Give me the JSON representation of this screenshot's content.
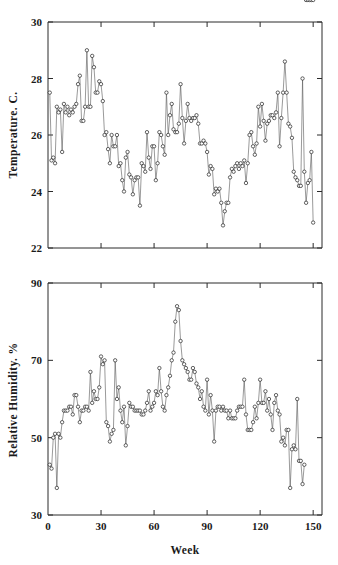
{
  "figure": {
    "background": "#ffffff",
    "line_color": "#555555",
    "marker_fill": "#ffffff",
    "marker_stroke": "#222222",
    "axis_color": "#2a2a2a"
  },
  "chart_data": [
    {
      "type": "line",
      "panel": "top",
      "title": "",
      "xlabel": "",
      "ylabel": "Temperature. C.",
      "xlim": [
        0,
        155
      ],
      "ylim": [
        22,
        30
      ],
      "yticks": [
        22,
        24,
        26,
        28,
        30
      ],
      "ytick_labels": [
        "22",
        "24",
        "26",
        "28",
        "30"
      ],
      "xticks": [
        0,
        30,
        60,
        90,
        120,
        150
      ],
      "xtick_labels": [
        "",
        "",
        "",
        "",
        "",
        ""
      ],
      "grid": false,
      "legend": "none",
      "marker": "circle-open",
      "x": [
        1,
        2,
        3,
        4,
        5,
        6,
        7,
        8,
        9,
        10,
        11,
        12,
        13,
        14,
        15,
        16,
        17,
        18,
        19,
        20,
        21,
        22,
        23,
        24,
        25,
        26,
        27,
        28,
        29,
        30,
        31,
        32,
        33,
        34,
        35,
        36,
        37,
        38,
        39,
        40,
        41,
        42,
        43,
        44,
        45,
        46,
        47,
        48,
        49,
        50,
        51,
        52,
        53,
        54,
        55,
        56,
        57,
        58,
        59,
        60,
        61,
        62,
        63,
        64,
        65,
        66,
        67,
        68,
        69,
        70,
        71,
        72,
        73,
        74,
        75,
        76,
        77,
        78,
        79,
        80,
        81,
        82,
        83,
        84,
        85,
        86,
        87,
        88,
        89,
        90,
        91,
        92,
        93,
        94,
        95,
        96,
        97,
        98,
        99,
        100,
        101,
        102,
        103,
        104,
        105,
        106,
        107,
        108,
        109,
        110,
        111,
        112,
        113,
        114,
        115,
        116,
        117,
        118,
        119,
        120,
        121,
        122,
        123,
        124,
        125,
        126,
        127,
        128,
        129,
        130,
        131,
        132,
        133,
        134,
        135,
        136,
        137,
        138,
        139,
        140,
        141,
        142,
        143,
        144,
        145,
        146,
        147,
        148,
        149,
        150
      ],
      "values": [
        27.5,
        25.1,
        25.2,
        25.0,
        27.0,
        26.8,
        26.9,
        25.4,
        27.1,
        26.8,
        27.0,
        26.7,
        26.9,
        26.8,
        27.0,
        27.1,
        27.8,
        28.1,
        26.5,
        26.5,
        27.0,
        29.0,
        27.0,
        27.0,
        28.8,
        28.4,
        27.5,
        27.5,
        27.9,
        27.8,
        27.2,
        26.0,
        26.1,
        25.5,
        25.0,
        26.0,
        25.6,
        25.6,
        26.0,
        24.9,
        25.0,
        24.4,
        24.0,
        25.2,
        25.4,
        24.6,
        24.5,
        23.9,
        24.4,
        24.5,
        24.5,
        23.5,
        25.0,
        24.9,
        24.7,
        26.1,
        25.2,
        24.8,
        25.6,
        25.6,
        24.4,
        25.0,
        26.1,
        26.0,
        25.6,
        25.3,
        27.5,
        26.0,
        26.7,
        27.1,
        26.2,
        26.1,
        26.1,
        26.4,
        27.8,
        26.6,
        25.7,
        26.5,
        27.1,
        26.6,
        26.5,
        26.6,
        26.6,
        26.7,
        26.4,
        25.7,
        25.7,
        25.8,
        25.7,
        25.4,
        24.6,
        24.9,
        24.8,
        23.9,
        24.1,
        24.0,
        24.1,
        23.6,
        22.8,
        23.3,
        23.6,
        23.6,
        24.5,
        24.8,
        24.7,
        24.9,
        25.0,
        24.8,
        25.0,
        24.9,
        25.1,
        24.3,
        25.0,
        26.0,
        26.1,
        25.6,
        25.3,
        25.7,
        27.0,
        26.3,
        27.1,
        26.5,
        25.8,
        26.4,
        26.5,
        26.7,
        26.7,
        26.6,
        26.8,
        27.5,
        25.6,
        26.6,
        27.5,
        28.6,
        27.5,
        26.4,
        26.3,
        25.9,
        24.7,
        24.5,
        24.4,
        24.2,
        24.2,
        28.0,
        24.7,
        23.6,
        24.3,
        24.4,
        25.4,
        22.9,
        25.0
      ]
    },
    {
      "type": "line",
      "panel": "bottom",
      "title": "",
      "xlabel": "Week",
      "ylabel": "Relative Humidity. %",
      "xlim": [
        0,
        155
      ],
      "ylim": [
        30,
        90
      ],
      "yticks": [
        30,
        50,
        70,
        90
      ],
      "ytick_labels": [
        "30",
        "50",
        "70",
        "90"
      ],
      "xticks": [
        0,
        30,
        60,
        90,
        120,
        150
      ],
      "xtick_labels": [
        "0",
        "30",
        "60",
        "90",
        "120",
        "150"
      ],
      "grid": false,
      "legend": "none",
      "marker": "circle-open",
      "x": [
        1,
        2,
        3,
        4,
        5,
        6,
        7,
        8,
        9,
        10,
        11,
        12,
        13,
        14,
        15,
        16,
        17,
        18,
        19,
        20,
        21,
        22,
        23,
        24,
        25,
        26,
        27,
        28,
        29,
        30,
        31,
        32,
        33,
        34,
        35,
        36,
        37,
        38,
        39,
        40,
        41,
        42,
        43,
        44,
        45,
        46,
        47,
        48,
        49,
        50,
        51,
        52,
        53,
        54,
        55,
        56,
        57,
        58,
        59,
        60,
        61,
        62,
        63,
        64,
        65,
        66,
        67,
        68,
        69,
        70,
        71,
        72,
        73,
        74,
        75,
        76,
        77,
        78,
        79,
        80,
        81,
        82,
        83,
        84,
        85,
        86,
        87,
        88,
        89,
        90,
        91,
        92,
        93,
        94,
        95,
        96,
        97,
        98,
        99,
        100,
        101,
        102,
        103,
        104,
        105,
        106,
        107,
        108,
        109,
        110,
        111,
        112,
        113,
        114,
        115,
        116,
        117,
        118,
        119,
        120,
        121,
        122,
        123,
        124,
        125,
        126,
        127,
        128,
        129,
        130,
        131,
        132,
        133,
        134,
        135,
        136,
        137,
        138,
        139,
        140,
        141,
        142,
        143,
        144,
        145,
        146,
        147,
        148,
        149,
        150
      ],
      "values": [
        43,
        42,
        50,
        51,
        37,
        51,
        50,
        54,
        57,
        57,
        57,
        58,
        58,
        56,
        61,
        61,
        58,
        54,
        57,
        57,
        58,
        58,
        57,
        67,
        59,
        62,
        60,
        60,
        63,
        71,
        69,
        70,
        54,
        53,
        49,
        51,
        52,
        70,
        60,
        63,
        57,
        54,
        58,
        48,
        53,
        59,
        58,
        58,
        57,
        57,
        57,
        57,
        56,
        56,
        57,
        59,
        62,
        57,
        58,
        59,
        62,
        61,
        68,
        62,
        58,
        57,
        61,
        63,
        66,
        70,
        72,
        80,
        84,
        83,
        75,
        70,
        69,
        68,
        67,
        65,
        65,
        68,
        67,
        64,
        63,
        60,
        62,
        58,
        57,
        65,
        56,
        61,
        57,
        49,
        57,
        58,
        58,
        57,
        58,
        57,
        57,
        55,
        57,
        55,
        55,
        55,
        57,
        58,
        58,
        58,
        65,
        56,
        52,
        52,
        52,
        54,
        58,
        55,
        59,
        65,
        59,
        59,
        62,
        57,
        60,
        56,
        52,
        59,
        61,
        57,
        56,
        49,
        50,
        48,
        52,
        52,
        37,
        47,
        48,
        47,
        60,
        44,
        44,
        38,
        43
      ]
    }
  ]
}
